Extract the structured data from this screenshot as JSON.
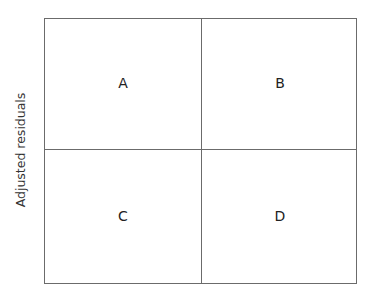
{
  "y_axis_label": "Adjusted residuals",
  "quadrants": {
    "top_left": "A",
    "top_right": "B",
    "bottom_left": "C",
    "bottom_right": "D"
  },
  "colors": {
    "line": "#6b6b6b",
    "text": "#222222",
    "background": "#ffffff"
  }
}
